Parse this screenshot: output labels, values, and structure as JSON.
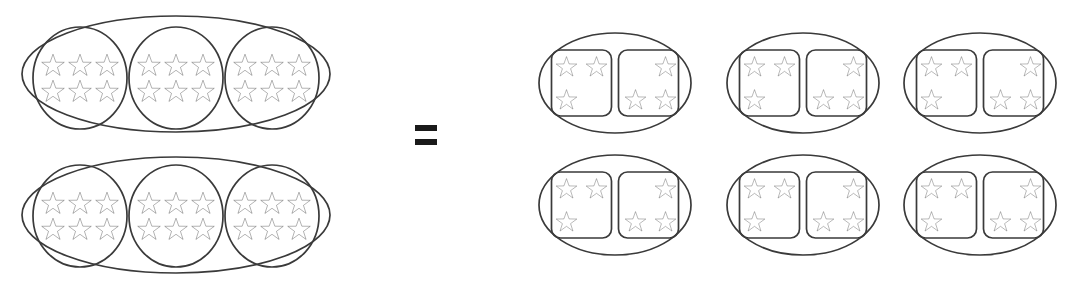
{
  "figure": {
    "type": "math-manipulative-diagram",
    "canvas": {
      "width": 1089,
      "height": 283
    },
    "colors": {
      "background": "#ffffff",
      "outline": "#3a3a3a",
      "star_stroke": "#2b2b2b",
      "star_fill": "#ffffff",
      "equals": "#1a1a1a"
    },
    "relation_symbol": "=",
    "icon_name": "star-icon"
  },
  "left_side": {
    "label": "left-expression",
    "outer_group_count": 2,
    "inner_group_count_each": 3,
    "stars_per_inner_group": 6,
    "star_rows_per_inner_group": 2,
    "star_columns_per_inner_group": 3,
    "total_stars": 36,
    "outer_groups": [
      {
        "name": "left-outer-group-1",
        "ellipse": {
          "cx": 176,
          "cy": 74,
          "rx": 154,
          "ry": 58
        },
        "inner_groups": [
          {
            "name": "left-outer-1-inner-1",
            "cx": 80,
            "cy": 78,
            "rx": 47,
            "ry": 51,
            "stars": 6
          },
          {
            "name": "left-outer-1-inner-2",
            "cx": 176,
            "cy": 78,
            "rx": 47,
            "ry": 51,
            "stars": 6
          },
          {
            "name": "left-outer-1-inner-3",
            "cx": 272,
            "cy": 78,
            "rx": 47,
            "ry": 51,
            "stars": 6
          }
        ]
      },
      {
        "name": "left-outer-group-2",
        "ellipse": {
          "cx": 176,
          "cy": 215,
          "rx": 154,
          "ry": 58
        },
        "inner_groups": [
          {
            "name": "left-outer-2-inner-1",
            "cx": 80,
            "cy": 216,
            "rx": 47,
            "ry": 51,
            "stars": 6
          },
          {
            "name": "left-outer-2-inner-2",
            "cx": 176,
            "cy": 216,
            "rx": 47,
            "ry": 51,
            "stars": 6
          },
          {
            "name": "left-outer-2-inner-3",
            "cx": 272,
            "cy": 216,
            "rx": 47,
            "ry": 51,
            "stars": 6
          }
        ]
      }
    ]
  },
  "equals": {
    "name": "equals-sign",
    "symbol": "=",
    "x": 415,
    "y": 125,
    "bar_width": 22,
    "bar_height": 6,
    "bar_gap": 8
  },
  "right_side": {
    "label": "right-expression",
    "group_count": 6,
    "rows": 2,
    "columns": 3,
    "boxes_per_group": 2,
    "stars_per_box": 3,
    "stars_per_group": 6,
    "total_stars": 36,
    "box_a_layout": {
      "name": "box-left-layout",
      "description": "two stars top, one star bottom-left",
      "star_positions": [
        [
          0,
          0
        ],
        [
          1,
          0
        ],
        [
          0,
          1
        ]
      ]
    },
    "box_b_layout": {
      "name": "box-right-layout",
      "description": "one star top-right, two stars bottom",
      "star_positions": [
        [
          1,
          0
        ],
        [
          0,
          1
        ],
        [
          1,
          1
        ]
      ]
    },
    "groups": [
      {
        "name": "right-group-r1c1",
        "cx": 615,
        "cy": 83,
        "rx": 76,
        "ry": 50
      },
      {
        "name": "right-group-r1c2",
        "cx": 803,
        "cy": 83,
        "rx": 76,
        "ry": 50
      },
      {
        "name": "right-group-r1c3",
        "cx": 980,
        "cy": 83,
        "rx": 76,
        "ry": 50
      },
      {
        "name": "right-group-r2c1",
        "cx": 615,
        "cy": 205,
        "rx": 76,
        "ry": 50
      },
      {
        "name": "right-group-r2c2",
        "cx": 803,
        "cy": 205,
        "rx": 76,
        "ry": 50
      },
      {
        "name": "right-group-r2c3",
        "cx": 980,
        "cy": 205,
        "rx": 76,
        "ry": 50
      }
    ]
  }
}
